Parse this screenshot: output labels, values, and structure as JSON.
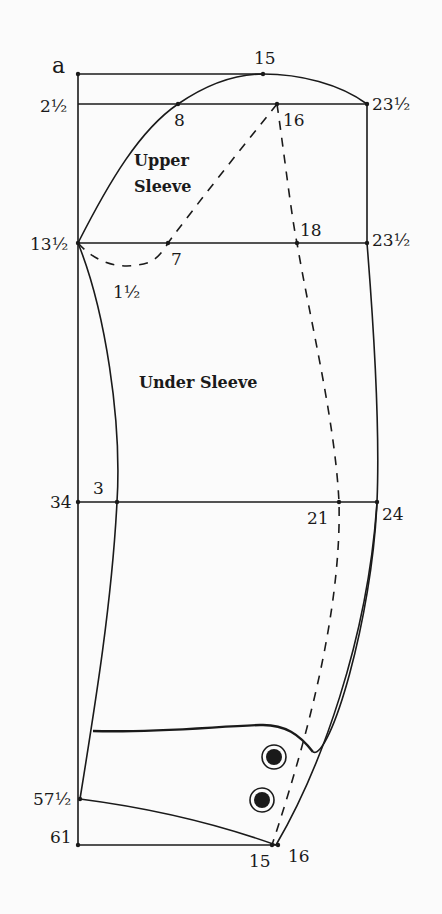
{
  "diagram": {
    "type": "sleeve-pattern-draft",
    "regions": {
      "upper_sleeve": [
        "Upper",
        "Sleeve"
      ],
      "under_sleeve": "Under Sleeve"
    },
    "left_labels": {
      "a": "a",
      "l2_5": "2½",
      "l13_5": "13½",
      "l34": "34",
      "l57_5": "57½",
      "l61": "61"
    },
    "right_labels": {
      "r23_5_top": "23½",
      "r23_5_mid": "23½",
      "r24": "24"
    },
    "point_labels": {
      "p15_top": "15",
      "p8": "8",
      "p16_top": "16",
      "p18": "18",
      "p7": "7",
      "p1_5": "1½",
      "p3": "3",
      "p21": "21",
      "p15_bottom": "15",
      "p16_bottom": "16"
    },
    "buttons": 2,
    "colors": {
      "ink": "#1a1a1a",
      "paper": "#fbfbfb"
    }
  }
}
